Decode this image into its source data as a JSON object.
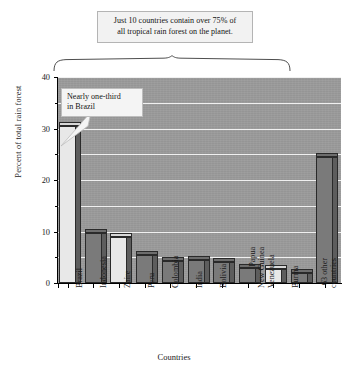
{
  "chart_data": {
    "type": "bar",
    "title": "",
    "xlabel": "Countries",
    "ylabel": "Percent of total rain forest",
    "ylim": [
      0,
      40
    ],
    "yticks": [
      0,
      10,
      20,
      30,
      40
    ],
    "yticks_minor": [
      5,
      15,
      25,
      35
    ],
    "grid": "horizontal gridlines every 5 units, white on gray plot background",
    "legend": "none",
    "categories": [
      "Brazil",
      "Indonesia",
      "Zaire",
      "Peru",
      "Colombia",
      "India",
      "Bolivia",
      "Papua New Guinea",
      "Venezuela",
      "Burma",
      "63 other countries"
    ],
    "values": [
      30.5,
      9.8,
      9.0,
      5.5,
      4.3,
      4.4,
      4.0,
      3.0,
      2.8,
      2.0,
      24.5
    ],
    "bar_styles": [
      "light",
      "dark",
      "light",
      "dark",
      "dark",
      "dark",
      "dark",
      "dark",
      "light",
      "dark",
      "dark"
    ],
    "annotations": [
      {
        "name": "top-callout",
        "lines": [
          "Just 10 countries contain over 75% of",
          "all tropical rain forest on the planet."
        ],
        "points_to": "brace spanning Brazil through Burma"
      },
      {
        "name": "brazil-callout",
        "lines": [
          "Nearly one-third",
          "in Brazil"
        ],
        "points_to": "Brazil bar"
      }
    ]
  },
  "axes": {
    "y_title": "Percent of total rain forest",
    "x_title": "Countries",
    "y_tick_labels": [
      "40",
      "30",
      "20",
      "10",
      "0"
    ]
  },
  "callouts": {
    "top": {
      "line1": "Just 10 countries contain over 75% of",
      "line2": "all tropical rain forest on the planet."
    },
    "brazil": {
      "line1": "Nearly one-third",
      "line2": "in Brazil"
    }
  },
  "labels": {
    "brazil": "Brazil",
    "indonesia": "Indonesia",
    "zaire": "Zaire",
    "peru": "Peru",
    "colombia": "Colombia",
    "india": "India",
    "bolivia": "Bolivia",
    "papua_1": "Papua",
    "papua_2": "New Guinea",
    "venezuela": "Venezuela",
    "burma": "Burma",
    "other_1": "63 other",
    "other_2": "countries"
  },
  "colors": {
    "plot_background": "#9a9a9a",
    "gridline": "#f0f0f0",
    "bar_light": "#e8e8e8",
    "bar_dark": "#7a7a7a",
    "bar_side": "#5d5d5d",
    "outline": "#2a2a2a",
    "callout_background": "#f2f2f2",
    "callout_border": "#b4b4b4"
  }
}
